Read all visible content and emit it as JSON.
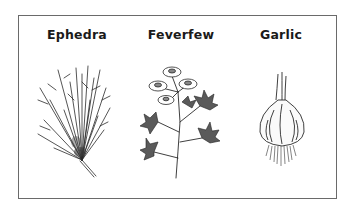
{
  "figure": {
    "panels": [
      {
        "label": "Ephedra",
        "illustration": "ephedra-plant-drawing"
      },
      {
        "label": "Feverfew",
        "illustration": "feverfew-plant-drawing"
      },
      {
        "label": "Garlic",
        "illustration": "garlic-bulb-drawing"
      }
    ],
    "colors": {
      "ink": "#1a1a1a",
      "border": "#6a6a6a",
      "background": "#ffffff"
    }
  }
}
